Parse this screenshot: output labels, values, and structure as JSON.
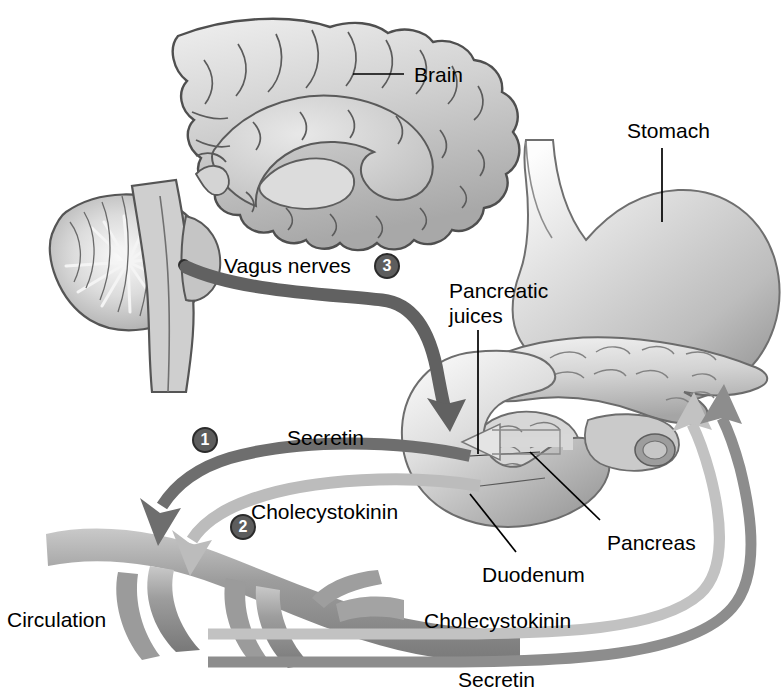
{
  "figure": {
    "background_color": "#ffffff",
    "width": 783,
    "height": 696
  },
  "labels": {
    "brain": "Brain",
    "stomach": "Stomach",
    "vagus_nerves": "Vagus nerves",
    "pancreatic_juices_line1": "Pancreatic",
    "pancreatic_juices_line2": "juices",
    "secretin_top": "Secretin",
    "cholecystokinin_top": "Cholecystokinin",
    "pancreas": "Pancreas",
    "duodenum": "Duodenum",
    "circulation": "Circulation",
    "cholecystokinin_bottom": "Cholecystokinin",
    "secretin_bottom": "Secretin"
  },
  "markers": [
    {
      "id": "marker-1",
      "number": "1",
      "refers_to": "Secretin"
    },
    {
      "id": "marker-2",
      "number": "2",
      "refers_to": "Cholecystokinin"
    },
    {
      "id": "marker-3",
      "number": "3",
      "refers_to": "Vagus nerves"
    }
  ],
  "colors": {
    "secretin_arrow": "#6e6e6e",
    "cholecystokinin_arrow": "#b6b6b6",
    "vagus_nerve": "#5a5a5a",
    "organ_light": "#d8d8d8",
    "organ_mid": "#b5b5b5",
    "organ_dark": "#8a8a8a",
    "outline": "#4a4a4a",
    "leader_line": "#000000",
    "marker_fill": "#5d5d5d",
    "marker_text": "#ffffff",
    "text": "#000000"
  },
  "structures": [
    "brain-sagittal-section",
    "cerebellum",
    "brainstem",
    "stomach",
    "pancreas",
    "duodenum",
    "blood-vessel-circulation"
  ]
}
